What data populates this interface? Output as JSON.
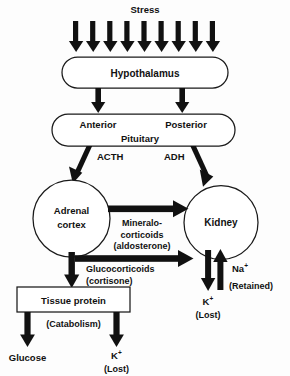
{
  "figure": {
    "title": "Stress",
    "background_color": "#fdfdfd",
    "ink_color": "#111111",
    "stroke_color": "#1a1a1a",
    "stipple_color": "#b9b9b9"
  },
  "nodes": {
    "hypothalamus": {
      "label": "Hypothalamus",
      "shape": "rounded-pill"
    },
    "pituitary": {
      "center_label": "Pituitary",
      "anterior_label": "Anterior",
      "posterior_label": "Posterior",
      "shape": "rounded-pill",
      "posterior_fill": "stippled"
    },
    "adrenal_cortex": {
      "line1": "Adrenal",
      "line2": "cortex",
      "shape": "circle"
    },
    "kidney": {
      "label": "Kidney",
      "shape": "circle"
    },
    "tissue_protein": {
      "label": "Tissue protein",
      "shape": "rectangle"
    }
  },
  "hormones": {
    "acth": "ACTH",
    "adh": "ADH",
    "mineralocorticoids": {
      "line1": "Mineralo-",
      "line2": "corticoids",
      "line3": "(aldosterone)"
    },
    "glucocorticoids": {
      "line1": "Glucocorticoids",
      "line2": "(cortisone)"
    }
  },
  "outputs": {
    "catabolism": "(Catabolism)",
    "glucose": "Glucose",
    "potassium_tissue": {
      "ion": "K",
      "charge": "+",
      "state": "(Lost)"
    },
    "potassium_kidney": {
      "ion": "K",
      "charge": "+",
      "state": "(Lost)"
    },
    "sodium_kidney": {
      "ion": "Na",
      "charge": "+",
      "state": "(Retained)"
    }
  },
  "stress_arrows": {
    "count": 9,
    "direction": "down"
  }
}
